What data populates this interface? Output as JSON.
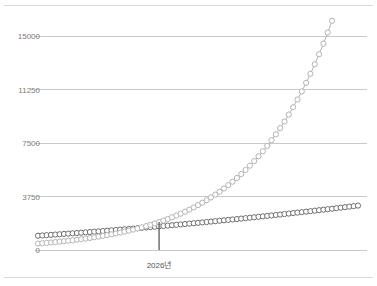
{
  "chart_data": {
    "type": "line",
    "title": "",
    "subtitle": "",
    "xlabel": "",
    "ylabel": "",
    "ylim": [
      0,
      15000
    ],
    "grid": true,
    "legend": "none",
    "y_ticks": [
      {
        "value": 15000,
        "label": "15000"
      },
      {
        "value": 11250,
        "label": "11250"
      },
      {
        "value": 7500,
        "label": "7500"
      },
      {
        "value": 3750,
        "label": "3750"
      },
      {
        "value": 0,
        "label": "0"
      }
    ],
    "x_ticks": [
      {
        "index": 28,
        "label": "2026년"
      }
    ],
    "annotations": [
      {
        "type": "vertical-marker",
        "at_index": 28,
        "label": "2026년",
        "color": "#5a5a5a"
      }
    ],
    "series": [
      {
        "name": "series-linear",
        "color": "#6e6e6e",
        "marker": "open-circle",
        "values": [
          1000,
          1020,
          1041,
          1062,
          1083,
          1104,
          1126,
          1148,
          1170,
          1192,
          1214,
          1237,
          1260,
          1283,
          1306,
          1330,
          1354,
          1378,
          1402,
          1426,
          1451,
          1476,
          1501,
          1526,
          1552,
          1578,
          1604,
          1630,
          1656,
          1683,
          1710,
          1737,
          1764,
          1792,
          1820,
          1848,
          1876,
          1904,
          1933,
          1962,
          1991,
          2020,
          2050,
          2080,
          2110,
          2140,
          2170,
          2201,
          2232,
          2263,
          2294,
          2326,
          2358,
          2390,
          2422,
          2454,
          2487,
          2520,
          2553,
          2586,
          2620,
          2654,
          2688,
          2722,
          2756,
          2791,
          2826,
          2861,
          2896,
          2932,
          2968,
          3004,
          3040,
          3076,
          3113
        ]
      },
      {
        "name": "series-exponential",
        "color": "#b4b4b4",
        "marker": "open-circle",
        "values": [
          450,
          474,
          500,
          527,
          555,
          585,
          617,
          650,
          685,
          722,
          761,
          802,
          845,
          891,
          939,
          990,
          1043,
          1099,
          1158,
          1221,
          1287,
          1356,
          1429,
          1506,
          1587,
          1673,
          1763,
          1858,
          1958,
          2064,
          2175,
          2293,
          2417,
          2547,
          2685,
          2830,
          2983,
          3144,
          3314,
          3493,
          3682,
          3881,
          4091,
          4312,
          4545,
          4790,
          5049,
          5322,
          5609,
          5912,
          6231,
          6568,
          6923,
          7297,
          7691,
          8106,
          8544,
          9006,
          9493,
          10006,
          10547,
          11117,
          11718,
          12351,
          13018,
          13721,
          14462,
          15243,
          16066,
          16934,
          17849,
          18814,
          19831,
          20903,
          22033
        ],
        "visible_max_value": 12400
      }
    ],
    "point_count": 75,
    "x_start_px": 38,
    "x_end_px": 358
  },
  "axes": {
    "y_axis_name": "value-axis",
    "x_axis_name": "time-axis"
  },
  "colors": {
    "gridline": "#c9c9c9",
    "rule": "#d8d8d8",
    "tick_text": "#7a7a7a",
    "xtick_text": "#555555",
    "series_a": "#6e6e6e",
    "series_b": "#b4b4b4",
    "marker_line": "#5a5a5a",
    "background": "#ffffff"
  }
}
